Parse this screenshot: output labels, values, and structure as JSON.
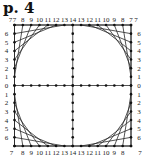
{
  "title": "p. 4",
  "diagram": {
    "type": "string-art-square",
    "square": {
      "x0": 14.5,
      "y0": 25,
      "x1": 131,
      "y1": 146
    },
    "colors": {
      "line": "#2a2a2a",
      "dot": "#111111",
      "label": "#222222"
    },
    "top_labels": [
      "7",
      "8",
      "9",
      "10",
      "11",
      "12",
      "13",
      "14",
      "13",
      "12",
      "11",
      "10",
      "9",
      "8",
      "7"
    ],
    "bottom_labels": [
      "7",
      "8",
      "9",
      "10",
      "11",
      "12",
      "13",
      "14",
      "13",
      "12",
      "11",
      "10",
      "9",
      "8",
      "7"
    ],
    "left_labels": [
      "7",
      "6",
      "5",
      "4",
      "3",
      "2",
      "1",
      "0",
      "1",
      "2",
      "3",
      "4",
      "5",
      "6",
      "7"
    ],
    "right_labels": [
      "7",
      "6",
      "5",
      "4",
      "3",
      "2",
      "1",
      "0",
      "1",
      "2",
      "3",
      "4",
      "5",
      "6",
      "7"
    ],
    "center_cross": {
      "horizontal_points": 15,
      "vertical_points": 15
    }
  }
}
